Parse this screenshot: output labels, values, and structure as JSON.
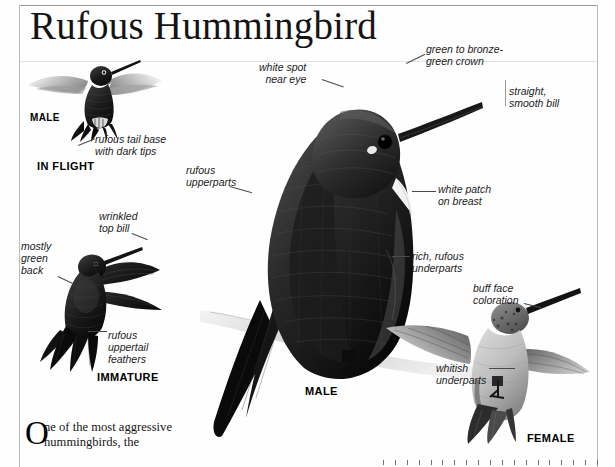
{
  "page": {
    "title": "Rufous Hummingbird",
    "background_color": "#fefefe",
    "rule_color": "#b9b9b9"
  },
  "figures": {
    "male_in_flight": {
      "caption_sex": "MALE",
      "caption_pose": "IN FLIGHT",
      "annotations": [
        {
          "id": "rufous-tail-base",
          "text": "rufous tail base\nwith dark tips"
        }
      ]
    },
    "immature": {
      "caption": "IMMATURE",
      "annotations": [
        {
          "id": "wrinkled-top-bill",
          "text": "wrinkled\ntop bill"
        },
        {
          "id": "mostly-green-back",
          "text": "mostly\ngreen\nback"
        },
        {
          "id": "rufous-uppertail-feathers",
          "text": "rufous\nuppertail\nfeathers"
        }
      ]
    },
    "male_perched": {
      "caption": "MALE",
      "annotations": [
        {
          "id": "white-spot-near-eye",
          "text": "white spot\nnear eye"
        },
        {
          "id": "green-bronze-crown",
          "text": "green to bronze-\ngreen crown"
        },
        {
          "id": "straight-smooth-bill",
          "text": "straight,\nsmooth bill"
        },
        {
          "id": "rufous-upperparts",
          "text": "rufous\nupperparts"
        },
        {
          "id": "white-patch-on-breast",
          "text": "white patch\non breast"
        },
        {
          "id": "rich-rufous-underparts",
          "text": "rich, rufous\nunderparts"
        }
      ]
    },
    "female": {
      "caption": "FEMALE",
      "annotations": [
        {
          "id": "buff-face-coloration",
          "text": "buff face\ncoloration"
        },
        {
          "id": "whitish-underparts",
          "text": "whitish\nunderparts"
        }
      ]
    }
  },
  "body_text": {
    "dropcap": "O",
    "paragraph": "ne of the most aggressive hummingbirds, the"
  },
  "scale_ruler": {
    "tick_count": 19
  }
}
